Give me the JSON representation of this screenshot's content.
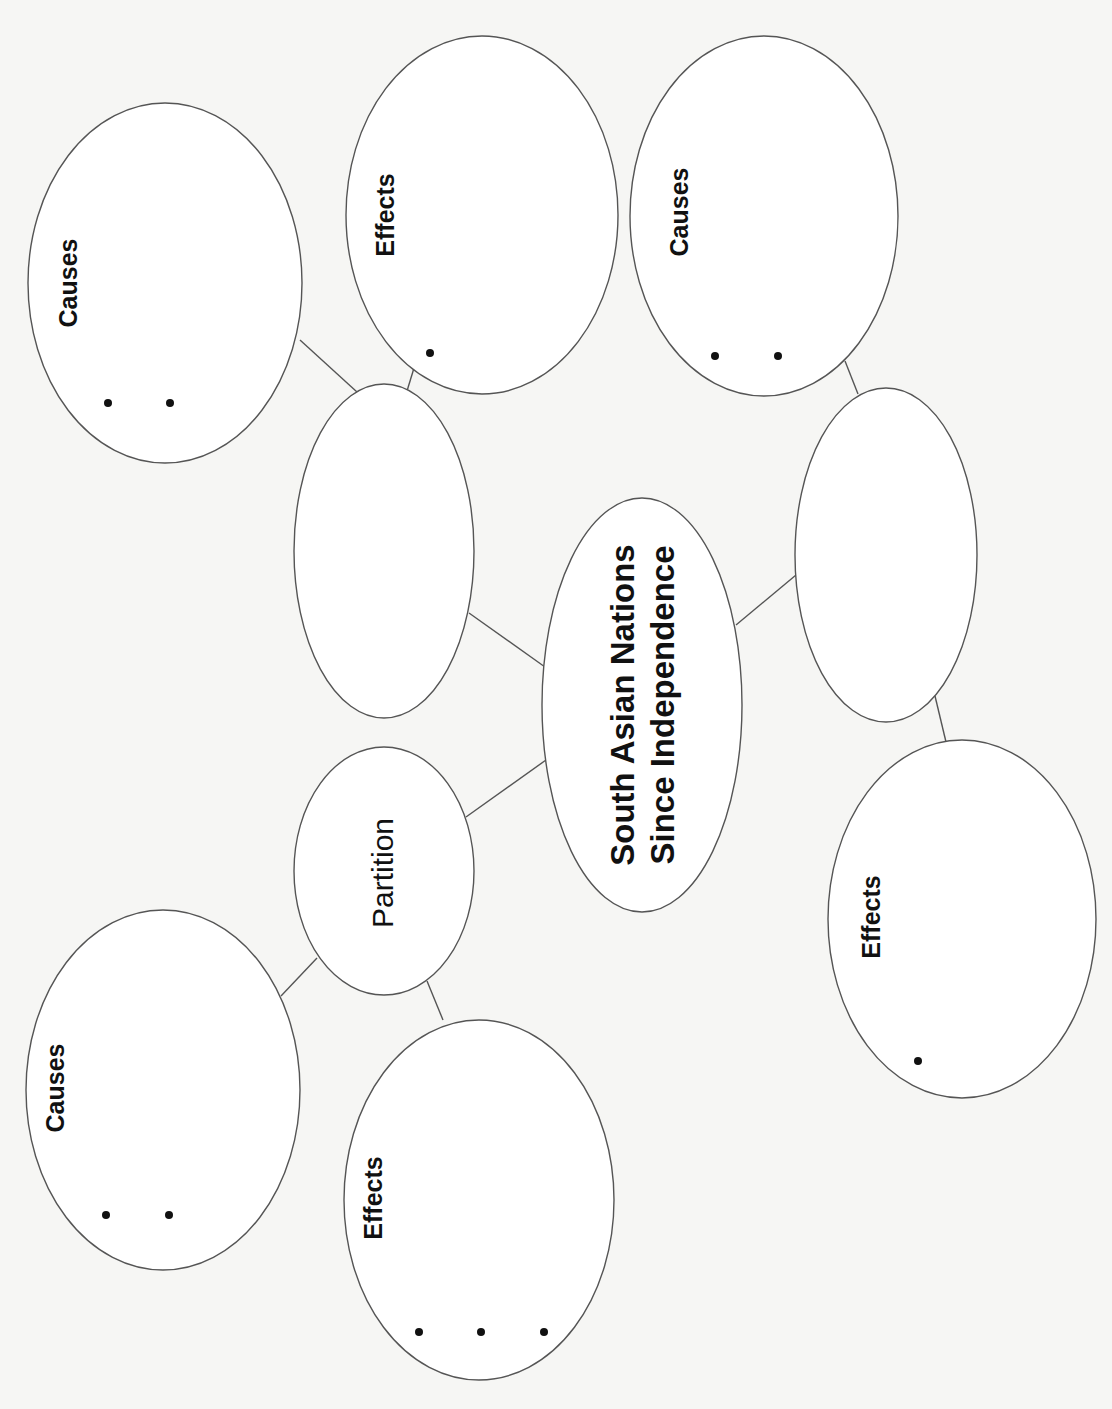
{
  "diagram": {
    "type": "concept-web",
    "orientation": "rotated-90-ccw",
    "colors": {
      "background": "#f6f6f4",
      "stroke": "#555555",
      "text": "#111111"
    },
    "center": {
      "title_line1": "South Asian Nations",
      "title_line2": "Since Independence"
    },
    "branches": [
      {
        "id": "branch-left-upper",
        "label": "",
        "causes": {
          "label": "Causes",
          "bullets": 2
        },
        "effects": {
          "label": "Effects",
          "bullets": 1
        }
      },
      {
        "id": "branch-right",
        "label": "",
        "causes": {
          "label": "Causes",
          "bullets": 2
        },
        "effects": {
          "label": "Effects",
          "bullets": 1
        }
      },
      {
        "id": "branch-partition",
        "label": "Partition",
        "causes": {
          "label": "Causes",
          "bullets": 2
        },
        "effects": {
          "label": "Effects",
          "bullets": 3
        }
      }
    ]
  }
}
